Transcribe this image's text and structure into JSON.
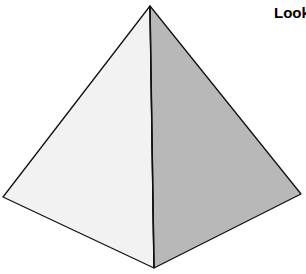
{
  "diagram": {
    "title_fragment": "Look",
    "shape": "pyramid",
    "faces": {
      "left": {
        "fill": "#f2f2f2"
      },
      "right": {
        "fill": "#b8b8b8"
      }
    },
    "vertices": {
      "apex": [
        150,
        6
      ],
      "left": [
        3,
        197
      ],
      "right": [
        301,
        194
      ],
      "bottom": [
        154,
        268
      ]
    },
    "stroke": "#111111"
  }
}
